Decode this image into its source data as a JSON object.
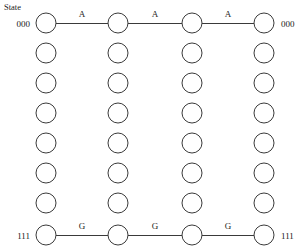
{
  "diagram": {
    "type": "trellis",
    "caption": "State",
    "rows": 8,
    "columns": 4,
    "geometry": {
      "width": 303,
      "height": 248,
      "column_x": [
        46,
        118,
        192,
        264
      ],
      "row_y": [
        23,
        53,
        83,
        113,
        143,
        173,
        203,
        235
      ],
      "node_radius": 10
    },
    "row_labels_left": [
      "000",
      "",
      "",
      "",
      "",
      "",
      "",
      "111"
    ],
    "row_labels_right": [
      "000",
      "",
      "",
      "",
      "",
      "",
      "",
      "111"
    ],
    "edges": [
      {
        "row": 0,
        "from_col": 0,
        "to_col": 1,
        "label": "A"
      },
      {
        "row": 0,
        "from_col": 1,
        "to_col": 2,
        "label": "A"
      },
      {
        "row": 0,
        "from_col": 2,
        "to_col": 3,
        "label": "A"
      },
      {
        "row": 7,
        "from_col": 0,
        "to_col": 1,
        "label": "G"
      },
      {
        "row": 7,
        "from_col": 1,
        "to_col": 2,
        "label": "G"
      },
      {
        "row": 7,
        "from_col": 2,
        "to_col": 3,
        "label": "G"
      }
    ],
    "colors": {
      "background": "#ffffff",
      "stroke": "#3a3a3a",
      "text": "#1a1a1a"
    }
  }
}
